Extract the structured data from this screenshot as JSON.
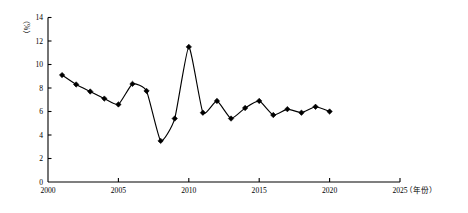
{
  "chart_data": {
    "type": "line",
    "title": "",
    "subtitle": "",
    "xlabel": "（年份）",
    "ylabel": "（%）",
    "xlim": [
      2000,
      2025
    ],
    "ylim": [
      0,
      14
    ],
    "grid": false,
    "legend": "none",
    "x_ticks": [
      "2000",
      "2005",
      "2010",
      "2015",
      "2020",
      "2025"
    ],
    "x_tick_values": [
      2000,
      2005,
      2010,
      2015,
      2020,
      2025
    ],
    "y_ticks": [
      "0",
      "2",
      "4",
      "6",
      "8",
      "10",
      "12",
      "14"
    ],
    "y_tick_values": [
      0,
      2,
      4,
      6,
      8,
      10,
      12,
      14
    ],
    "marker": "diamond",
    "line_color": "#000000",
    "marker_color": "#000000",
    "axis_color": "#000000",
    "x": [
      2001,
      2002,
      2003,
      2004,
      2005,
      2006,
      2007,
      2008,
      2009,
      2010,
      2011,
      2012,
      2013,
      2014,
      2015,
      2016,
      2017,
      2018,
      2019,
      2020
    ],
    "values": [
      9.1,
      8.3,
      7.7,
      7.1,
      6.6,
      8.35,
      7.75,
      3.5,
      5.4,
      11.5,
      5.9,
      6.9,
      5.4,
      6.3,
      6.9,
      5.7,
      6.2,
      5.9,
      6.4,
      6.0
    ],
    "series": [
      {
        "name": "",
        "values": [
          9.1,
          8.3,
          7.7,
          7.1,
          6.6,
          8.35,
          7.75,
          3.5,
          5.4,
          11.5,
          5.9,
          6.9,
          5.4,
          6.3,
          6.9,
          5.7,
          6.2,
          5.9,
          6.4,
          6.0
        ]
      }
    ],
    "annotations": []
  }
}
